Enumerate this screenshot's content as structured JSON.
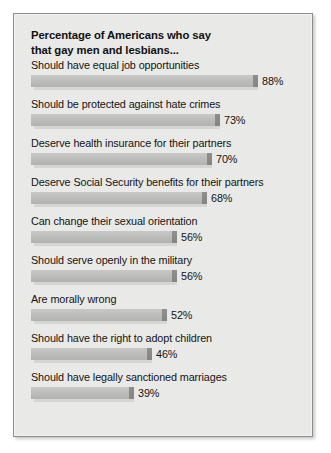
{
  "figure": {
    "background_color": "#e9e9e7",
    "border_color": "#8d8d8b",
    "bar_color": "#bdbdbb",
    "bar_cap_color": "#8a8a88",
    "text_color": "#141414"
  },
  "chart_data": {
    "type": "bar",
    "title": "Percentage of Americans who say\nthat gay men and lesbians...",
    "subtitle": "",
    "xlabel": "",
    "ylabel": "",
    "orientation": "horizontal",
    "grid": false,
    "legend": false,
    "xlim": [
      0,
      100
    ],
    "value_suffix": "%",
    "categories": [
      "Should have equal job opportunities",
      "Should be protected against hate crimes",
      "Deserve health insurance for their partners",
      "Deserve Social Security benefits for their partners",
      "Can change their sexual orientation",
      "Should serve openly in the military",
      "Are morally wrong",
      "Should have the right to adopt children",
      "Should have legally sanctioned marriages"
    ],
    "values": [
      88,
      73,
      70,
      68,
      56,
      56,
      52,
      46,
      39
    ],
    "value_labels": [
      "88%",
      "73%",
      "70%",
      "68%",
      "56%",
      "56%",
      "52%",
      "46%",
      "39%"
    ],
    "items": [
      {
        "label": "Should have equal job opportunities",
        "value": 88,
        "value_label": "88%"
      },
      {
        "label": "Should be protected against hate crimes",
        "value": 73,
        "value_label": "73%"
      },
      {
        "label": "Deserve health insurance for their partners",
        "value": 70,
        "value_label": "70%"
      },
      {
        "label": "Deserve Social Security benefits for their partners",
        "value": 68,
        "value_label": "68%"
      },
      {
        "label": "Can change their sexual orientation",
        "value": 56,
        "value_label": "56%"
      },
      {
        "label": "Should serve openly in the military",
        "value": 56,
        "value_label": "56%"
      },
      {
        "label": "Are morally wrong",
        "value": 52,
        "value_label": "52%"
      },
      {
        "label": "Should have the right to adopt children",
        "value": 46,
        "value_label": "46%"
      },
      {
        "label": "Should have legally sanctioned marriages",
        "value": 39,
        "value_label": "39%"
      }
    ]
  }
}
